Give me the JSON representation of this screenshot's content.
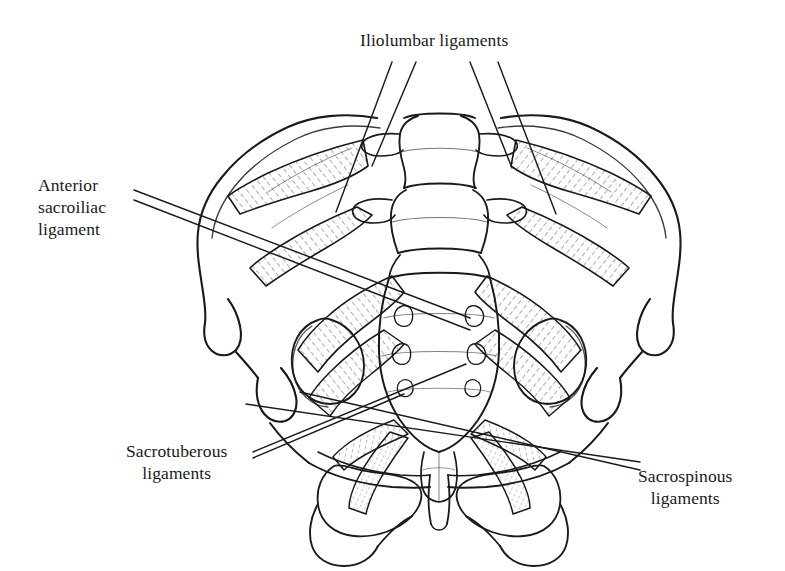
{
  "figure": {
    "view": "anterior",
    "background_color": "#ffffff",
    "ink_color": "#1a1a1a",
    "width": 785,
    "height": 571
  },
  "labels": {
    "iliolumbar": {
      "line1": "Iliolumbar ligaments"
    },
    "anterior_sacroiliac": {
      "line1": "Anterior",
      "line2": "sacroiliac",
      "line3": "ligament"
    },
    "sacrotuberous": {
      "line1": "Sacrotuberous",
      "line2": "ligaments"
    },
    "sacrospinous": {
      "line1": "Sacrospinous",
      "line2": "ligaments"
    }
  },
  "structures": [
    "lumbar vertebrae L4 L5",
    "sacrum",
    "coccyx",
    "left ilium",
    "right ilium",
    "iliac crest",
    "anterior superior iliac spine",
    "anterior inferior iliac spine",
    "acetabulum",
    "obturator foramen",
    "pubic symphysis",
    "ischial tuberosity",
    "anterior sacral foramina"
  ]
}
